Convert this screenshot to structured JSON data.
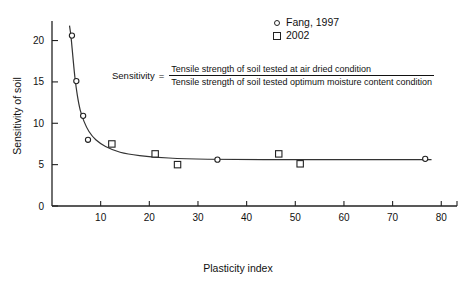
{
  "chart_data": {
    "type": "scatter",
    "title": "",
    "xlabel": "Plasticity index",
    "ylabel": "Sensitivity of soil",
    "xlim": [
      0,
      82
    ],
    "ylim": [
      0,
      22
    ],
    "xticks": [
      10,
      20,
      30,
      40,
      50,
      60,
      70,
      80
    ],
    "yticks": [
      0,
      5,
      10,
      15,
      20
    ],
    "grid": false,
    "legend_position": "top-right",
    "series": [
      {
        "name": "Fang, 1997",
        "marker": "circle",
        "points": [
          {
            "x": 4.1,
            "y": 20.6
          },
          {
            "x": 5.0,
            "y": 15.1
          },
          {
            "x": 6.4,
            "y": 10.9
          },
          {
            "x": 7.4,
            "y": 8.0
          },
          {
            "x": 34.0,
            "y": 5.6
          },
          {
            "x": 76.7,
            "y": 5.7
          }
        ]
      },
      {
        "name": "2002",
        "marker": "square",
        "points": [
          {
            "x": 12.3,
            "y": 7.5
          },
          {
            "x": 21.2,
            "y": 6.3
          },
          {
            "x": 25.8,
            "y": 5.0
          },
          {
            "x": 46.6,
            "y": 6.3
          },
          {
            "x": 51.0,
            "y": 5.1
          }
        ]
      }
    ],
    "fit_curve": {
      "name": "fitted decay curve",
      "points": [
        {
          "x": 3.6,
          "y": 21.8
        },
        {
          "x": 3.9,
          "y": 20.5
        },
        {
          "x": 4.3,
          "y": 18.0
        },
        {
          "x": 4.7,
          "y": 15.6
        },
        {
          "x": 5.2,
          "y": 13.4
        },
        {
          "x": 5.8,
          "y": 11.6
        },
        {
          "x": 6.6,
          "y": 10.2
        },
        {
          "x": 7.6,
          "y": 9.0
        },
        {
          "x": 9.0,
          "y": 8.0
        },
        {
          "x": 11.0,
          "y": 7.2
        },
        {
          "x": 14.0,
          "y": 6.5
        },
        {
          "x": 18.0,
          "y": 6.1
        },
        {
          "x": 24.0,
          "y": 5.8
        },
        {
          "x": 32.0,
          "y": 5.65
        },
        {
          "x": 45.0,
          "y": 5.6
        },
        {
          "x": 60.0,
          "y": 5.6
        },
        {
          "x": 78.0,
          "y": 5.6
        }
      ]
    },
    "annotation": {
      "lhs": "Sensitivity",
      "equals": "=",
      "numerator": "Tensile strength of soil tested at air dried condition",
      "denominator": "Tensile strength of soil tested optimum moisture content condition"
    }
  },
  "legend": {
    "items": [
      {
        "label": "Fang, 1997",
        "marker": "circle"
      },
      {
        "label": "2002",
        "marker": "square"
      }
    ]
  },
  "axes": {
    "x_label": "Plasticity index",
    "y_label": "Sensitivity of soil",
    "x_tick_labels": [
      "10",
      "20",
      "30",
      "40",
      "50",
      "60",
      "70",
      "80"
    ],
    "y_tick_labels": [
      "0",
      "5",
      "10",
      "15",
      "20"
    ]
  },
  "colors": {
    "axis": "#222222",
    "marker": "#222222",
    "curve": "#333333",
    "background": "#ffffff"
  }
}
